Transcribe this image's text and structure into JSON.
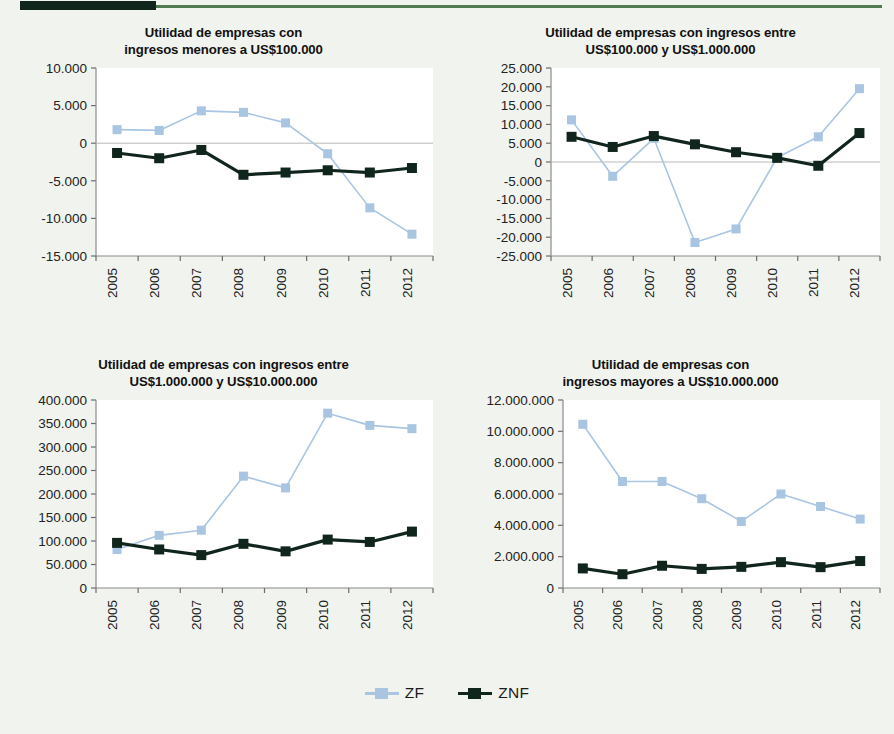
{
  "header": {
    "rule_block_color": "#10261d",
    "rule_line_color": "#4f7a52"
  },
  "page": {
    "background_color": "#f1f4ee",
    "plot_background_color": "#ffffff"
  },
  "legend": {
    "position": "bottom-center",
    "items": [
      {
        "label": "ZF",
        "color": "#a9c5e2"
      },
      {
        "label": "ZNF",
        "color": "#10261d"
      }
    ]
  },
  "series_colors": {
    "ZF": "#a9c5e2",
    "ZNF": "#10261d"
  },
  "chart_data": [
    {
      "type": "line",
      "title": "Utilidad de empresas con\ningresos menores a US$100.000",
      "title_line1": "Utilidad de empresas con",
      "title_line2": "ingresos menores a US$100.000",
      "xlabel": "",
      "ylabel": "",
      "x": [
        "2005",
        "2006",
        "2007",
        "2008",
        "2009",
        "2010",
        "2011",
        "2012"
      ],
      "categories": [
        "2005",
        "2006",
        "2007",
        "2008",
        "2009",
        "2010",
        "2011",
        "2012"
      ],
      "ylim": [
        -15000,
        10000
      ],
      "yticks": [
        10000,
        5000,
        0,
        -5000,
        -10000,
        -15000
      ],
      "ytick_labels": [
        "10.000",
        "5.000",
        "0",
        "-5.000",
        "-10.000",
        "-15.000"
      ],
      "grid": false,
      "zero_line": true,
      "series": [
        {
          "name": "ZF",
          "values": [
            1800,
            1700,
            4300,
            4100,
            2700,
            -1400,
            -8600,
            -12100
          ]
        },
        {
          "name": "ZNF",
          "values": [
            -1300,
            -2000,
            -900,
            -4200,
            -3900,
            -3600,
            -3900,
            -3300
          ]
        }
      ]
    },
    {
      "type": "line",
      "title": "Utilidad de empresas con ingresos entre\nUS$100.000 y US$1.000.000",
      "title_line1": "Utilidad de empresas con ingresos entre",
      "title_line2": "US$100.000 y US$1.000.000",
      "xlabel": "",
      "ylabel": "",
      "x": [
        "2005",
        "2006",
        "2007",
        "2008",
        "2009",
        "2010",
        "2011",
        "2012"
      ],
      "categories": [
        "2005",
        "2006",
        "2007",
        "2008",
        "2009",
        "2010",
        "2011",
        "2012"
      ],
      "ylim": [
        -25000,
        25000
      ],
      "yticks": [
        25000,
        20000,
        15000,
        10000,
        5000,
        0,
        -5000,
        -10000,
        -15000,
        -20000,
        -25000
      ],
      "ytick_labels": [
        "25.000",
        "20.000",
        "15.000",
        "10.000",
        "5.000",
        "0",
        "-5.000",
        "-10.000",
        "-15.000",
        "-20.000",
        "-25.000"
      ],
      "grid": false,
      "zero_line": true,
      "series": [
        {
          "name": "ZF",
          "values": [
            11200,
            -3800,
            6300,
            -21400,
            -17800,
            1200,
            6700,
            19500
          ]
        },
        {
          "name": "ZNF",
          "values": [
            6700,
            4000,
            6900,
            4700,
            2600,
            1100,
            -1000,
            7700
          ]
        }
      ]
    },
    {
      "type": "line",
      "title": "Utilidad de empresas con ingresos entre\nUS$1.000.000 y US$10.000.000",
      "title_line1": "Utilidad de empresas con ingresos entre",
      "title_line2": "US$1.000.000 y US$10.000.000",
      "xlabel": "",
      "ylabel": "",
      "x": [
        "2005",
        "2006",
        "2007",
        "2008",
        "2009",
        "2010",
        "2011",
        "2012"
      ],
      "categories": [
        "2005",
        "2006",
        "2007",
        "2008",
        "2009",
        "2010",
        "2011",
        "2012"
      ],
      "ylim": [
        0,
        400000
      ],
      "yticks": [
        400000,
        350000,
        300000,
        250000,
        200000,
        150000,
        100000,
        50000,
        0
      ],
      "ytick_labels": [
        "400.000",
        "350.000",
        "300.000",
        "250.000",
        "200.000",
        "150.000",
        "100.000",
        "50.000",
        "0"
      ],
      "grid": false,
      "zero_line": false,
      "series": [
        {
          "name": "ZF",
          "values": [
            82000,
            112000,
            123000,
            238000,
            213000,
            372000,
            346000,
            339000
          ]
        },
        {
          "name": "ZNF",
          "values": [
            96000,
            82000,
            70000,
            94000,
            78000,
            103000,
            98000,
            120000
          ]
        }
      ]
    },
    {
      "type": "line",
      "title": "Utilidad de empresas con\ningresos mayores a US$10.000.000",
      "title_line1": "Utilidad de empresas con",
      "title_line2": "ingresos mayores a US$10.000.000",
      "xlabel": "",
      "ylabel": "",
      "x": [
        "2005",
        "2006",
        "2007",
        "2008",
        "2009",
        "2010",
        "2011",
        "2012"
      ],
      "categories": [
        "2005",
        "2006",
        "2007",
        "2008",
        "2009",
        "2010",
        "2011",
        "2012"
      ],
      "ylim": [
        0,
        12000000
      ],
      "yticks": [
        12000000,
        10000000,
        8000000,
        6000000,
        4000000,
        2000000,
        0
      ],
      "ytick_labels": [
        "12.000.000",
        "10.000.000",
        "8.000.000",
        "6.000.000",
        "4.000.000",
        "2.000.000",
        "0"
      ],
      "grid": false,
      "zero_line": false,
      "series": [
        {
          "name": "ZF",
          "values": [
            10450000,
            6800000,
            6800000,
            5700000,
            4250000,
            6000000,
            5200000,
            4400000
          ]
        },
        {
          "name": "ZNF",
          "values": [
            1250000,
            880000,
            1420000,
            1220000,
            1350000,
            1650000,
            1330000,
            1720000
          ]
        }
      ]
    }
  ]
}
